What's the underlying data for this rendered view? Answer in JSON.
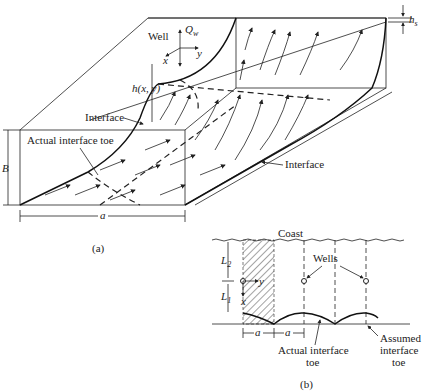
{
  "figure": {
    "part_a": {
      "caption": "(a)",
      "labels": {
        "well": "Well",
        "discharge": "Q",
        "discharge_sub": "w",
        "axis_x": "x",
        "axis_y": "y",
        "head": "h(x, y)",
        "interface_left": "Interface",
        "interface_right": "Interface",
        "actual_toe": "Actual interface toe",
        "thickness": "B",
        "spacing": "a",
        "hs": "h",
        "hs_sub": "s"
      }
    },
    "part_b": {
      "caption": "(b)",
      "labels": {
        "coast": "Coast",
        "wells": "Wells",
        "L2": "L",
        "L2_sub": "2",
        "L1": "L",
        "L1_sub": "1",
        "axis_x": "x",
        "axis_y": "y",
        "spacing_1": "a",
        "spacing_2": "a",
        "actual_toe_line1": "Actual interface",
        "actual_toe_line2": "toe",
        "assumed_toe_line1": "Assumed",
        "assumed_toe_line2": "interface",
        "assumed_toe_line3": "toe"
      }
    }
  }
}
